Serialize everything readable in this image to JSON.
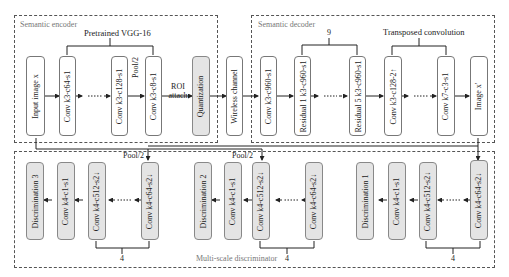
{
  "encoder": {
    "title": "Semantic encoder",
    "bracket_label": "Pretrained VGG-16",
    "blocks": [
      "Input image x",
      "Conv k3-c64-s1",
      "Conv k3-c128-s1",
      "Conv k3-c8-s1",
      "Quantization"
    ],
    "pool_label": "Pool/2",
    "roi_label_1": "ROI",
    "roi_label_2": "attach"
  },
  "channel": {
    "label": "Wireless channel"
  },
  "decoder": {
    "title": "Semantic decoder",
    "residual_repeat": "9",
    "transposed_label": "Transposed convolution",
    "blocks": [
      "Conv k3-c960-s1",
      "Residual 1 k3-c960-s1",
      "Residual 5 k3-c960-s1",
      "Conv k3-c128-2↑",
      "Conv k7-c3-s1",
      "Image x'"
    ]
  },
  "discriminator": {
    "title": "Multi-scale discriminator",
    "pool_label_1": "Pool/2",
    "pool_label_2": "Pool/2",
    "scales": [
      {
        "blocks": [
          "Discrimination 3",
          "Conv k4-c1-s1",
          "Conv k4-c512-s2↓",
          "Conv k4-c64-s2↓"
        ],
        "repeat": "4"
      },
      {
        "blocks": [
          "Discrimination 2",
          "Conv k4-c1-s1",
          "Conv k4-c512-s2↓",
          "Conv k4-c64-s2↓"
        ],
        "repeat": "4"
      },
      {
        "blocks": [
          "Discrimination 1",
          "Conv k4-c1-s1",
          "Conv k4-c512-s2↓",
          "Conv k4-c64-s2↓"
        ],
        "repeat": "4"
      }
    ]
  }
}
